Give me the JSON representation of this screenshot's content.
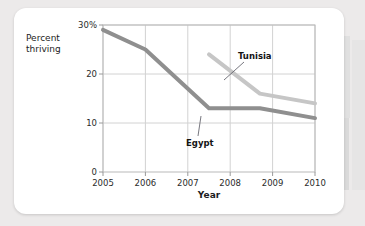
{
  "chart_data": {
    "type": "line",
    "title": "",
    "xlabel": "Year",
    "ylabel": "Percent thriving",
    "ylabel_line1": "Percent",
    "ylabel_line2": "thriving",
    "x": [
      2005,
      2006,
      2007,
      2008,
      2009,
      2010
    ],
    "xlim": [
      2005,
      2010
    ],
    "ylim": [
      0,
      30
    ],
    "yticks": [
      0,
      10,
      20,
      30
    ],
    "ytick_labels": [
      "0",
      "10",
      "20",
      "30%"
    ],
    "xtick_labels": [
      "2005",
      "2006",
      "2007",
      "2008",
      "2009",
      "2010"
    ],
    "grid": "both",
    "legend": "inline-annotations",
    "series": [
      {
        "name": "Egypt",
        "color": "#8f8f8f",
        "points": [
          {
            "x": 2005,
            "y": 29
          },
          {
            "x": 2006,
            "y": 25
          },
          {
            "x": 2007.5,
            "y": 13
          },
          {
            "x": 2008.7,
            "y": 13
          },
          {
            "x": 2010,
            "y": 11
          }
        ]
      },
      {
        "name": "Tunisia",
        "color": "#c6c6c6",
        "points": [
          {
            "x": 2007.5,
            "y": 24
          },
          {
            "x": 2008.7,
            "y": 16
          },
          {
            "x": 2010,
            "y": 14
          }
        ]
      }
    ],
    "annotations": [
      {
        "label": "Tunisia",
        "series": "Tunisia"
      },
      {
        "label": "Egypt",
        "series": "Egypt"
      }
    ]
  }
}
